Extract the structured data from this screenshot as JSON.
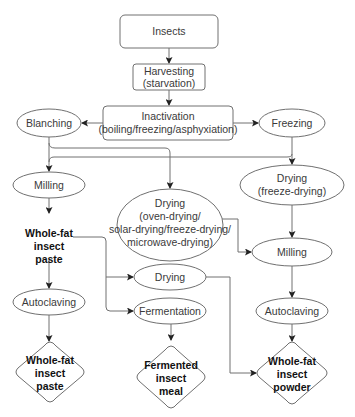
{
  "diagram": {
    "type": "flowchart",
    "nodes": {
      "insects": {
        "lines": [
          "Insects"
        ]
      },
      "harvesting": {
        "lines": [
          "Harvesting",
          "(starvation)"
        ]
      },
      "inactivation": {
        "lines": [
          "Inactivation",
          "(boiling/freezing/asphyxiation)"
        ]
      },
      "blanching": {
        "lines": [
          "Blanching"
        ]
      },
      "freezing": {
        "lines": [
          "Freezing"
        ]
      },
      "milling_left": {
        "lines": [
          "Milling"
        ]
      },
      "drying_center": {
        "lines": [
          "Drying",
          "(oven-drying/",
          "solar-drying/freeze-drying/",
          "microwave-drying)"
        ]
      },
      "drying_freeze": {
        "lines": [
          "Drying",
          "(freeze-drying)"
        ]
      },
      "milling_right": {
        "lines": [
          "Milling"
        ]
      },
      "paste_intermediate": {
        "lines": [
          "Whole-fat",
          "insect",
          "paste"
        ]
      },
      "drying_small": {
        "lines": [
          "Drying"
        ]
      },
      "fermentation": {
        "lines": [
          "Fermentation"
        ]
      },
      "autoclaving_left": {
        "lines": [
          "Autoclaving"
        ]
      },
      "autoclaving_right": {
        "lines": [
          "Autoclaving"
        ]
      },
      "product_paste": {
        "lines": [
          "Whole-fat",
          "insect",
          "paste"
        ]
      },
      "product_meal": {
        "lines": [
          "Fermented",
          "insect",
          "meal"
        ]
      },
      "product_powder": {
        "lines": [
          "Whole-fat",
          "insect",
          "powder"
        ]
      }
    },
    "edges": [
      [
        "insects",
        "harvesting"
      ],
      [
        "harvesting",
        "inactivation"
      ],
      [
        "inactivation",
        "blanching"
      ],
      [
        "inactivation",
        "freezing"
      ],
      [
        "blanching",
        "milling_left"
      ],
      [
        "blanching",
        "drying_center"
      ],
      [
        "freezing",
        "milling_left"
      ],
      [
        "freezing",
        "drying_freeze"
      ],
      [
        "milling_left",
        "paste_intermediate"
      ],
      [
        "drying_center",
        "milling_right"
      ],
      [
        "drying_freeze",
        "milling_right"
      ],
      [
        "paste_intermediate",
        "drying_small"
      ],
      [
        "paste_intermediate",
        "fermentation"
      ],
      [
        "paste_intermediate",
        "autoclaving_left"
      ],
      [
        "milling_right",
        "autoclaving_right"
      ],
      [
        "autoclaving_left",
        "product_paste"
      ],
      [
        "fermentation",
        "product_meal"
      ],
      [
        "drying_small",
        "product_powder"
      ],
      [
        "autoclaving_right",
        "product_powder"
      ]
    ],
    "colors": {
      "stroke": "#707070",
      "text": "#3a3a3a",
      "bold_text": "#111111",
      "background": "#ffffff"
    }
  }
}
